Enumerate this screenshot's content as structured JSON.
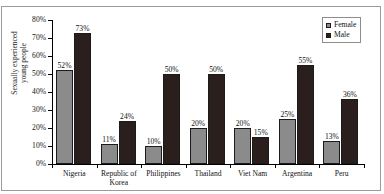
{
  "figure": {
    "cut_off_caption_fragment": ""
  },
  "chart_data": {
    "type": "bar",
    "title": "",
    "xlabel": "",
    "ylabel_lines": [
      "Sexually experienced",
      "young people"
    ],
    "ylim": [
      0,
      80
    ],
    "ytick_step": 10,
    "ytick_labels": [
      "0%",
      "10%",
      "20%",
      "30%",
      "40%",
      "50%",
      "60%",
      "70%",
      "80%"
    ],
    "grid": false,
    "legend_position": "top-right",
    "categories": [
      {
        "lines": [
          "Nigeria"
        ]
      },
      {
        "lines": [
          "Republic of",
          "Korea"
        ]
      },
      {
        "lines": [
          "Philippines"
        ]
      },
      {
        "lines": [
          "Thailand"
        ]
      },
      {
        "lines": [
          "Viet Nam"
        ]
      },
      {
        "lines": [
          "Argentina"
        ]
      },
      {
        "lines": [
          "Peru"
        ]
      }
    ],
    "series": [
      {
        "name": "Female",
        "color": "#8b8b8b",
        "values": [
          52,
          11,
          10,
          20,
          20,
          25,
          13
        ],
        "labels": [
          "52%",
          "11%",
          "10%",
          "20%",
          "20%",
          "25%",
          "13%"
        ]
      },
      {
        "name": "Male",
        "color": "#2a1f1d",
        "values": [
          73,
          24,
          50,
          50,
          15,
          55,
          36
        ],
        "labels": [
          "73%",
          "24%",
          "50%",
          "50%",
          "15%",
          "55%",
          "36%"
        ]
      }
    ]
  }
}
